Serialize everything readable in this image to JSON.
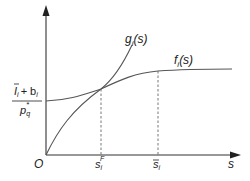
{
  "diagram": {
    "curves": {
      "g": {
        "label_main": "g",
        "label_sub": "i",
        "label_arg": "(s)"
      },
      "f": {
        "label_main": "f",
        "label_sub": "i",
        "label_arg": "(s)"
      }
    },
    "y_axis": {
      "intercept_label": {
        "numerator_main": "I",
        "numerator_sub": "i",
        "numerator_plus": "+ b",
        "numerator_sub2": "i",
        "denominator_main": "p",
        "denominator_sub": "q",
        "denominator_sup": "*"
      }
    },
    "x_axis": {
      "label": "s",
      "origin_label": "O",
      "ticks": [
        {
          "main": "s",
          "sub": "i",
          "sup": "F"
        },
        {
          "main": "s",
          "sub": "i",
          "bar": true
        }
      ]
    },
    "colors": {
      "axis": "#333333",
      "curve": "#555555",
      "dash": "#666666",
      "text": "#222222"
    }
  }
}
